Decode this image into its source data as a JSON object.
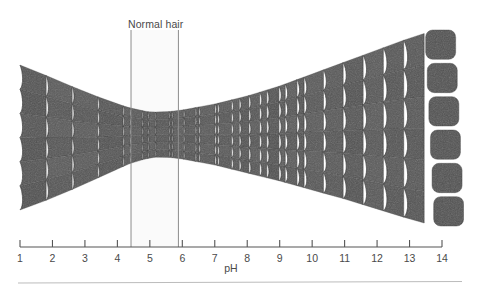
{
  "figure": {
    "type": "hair-cuticle-vs-ph-diagram",
    "background_color": "#ffffff",
    "scale_fill_color": "#565656",
    "scale_fill_color_dark": "#4a4a4a",
    "scale_edge_color": "#2e2e2e",
    "axis_color": "#555555",
    "text_color": "#4a4a4a",
    "marker_line_color": "#8c8c8c",
    "band_fill_color": "#fafafa",
    "rule_color": "#bcbcbc"
  },
  "annotation": {
    "normal_hair_label": "Normal hair",
    "label_x": 128,
    "label_y": 18,
    "band_start_ph": 4.42,
    "band_end_ph": 5.88,
    "line_top_y": 30,
    "line_bottom_y": 247
  },
  "axis": {
    "label": "pH",
    "label_x": 231,
    "label_y": 262,
    "min": 1,
    "max": 14,
    "line_y": 247,
    "tick_top_y": 240,
    "x_at_min": 20,
    "x_at_max": 442,
    "ticks": [
      {
        "value": 1,
        "label": "1"
      },
      {
        "value": 2,
        "label": "2"
      },
      {
        "value": 3,
        "label": "3"
      },
      {
        "value": 4,
        "label": "4"
      },
      {
        "value": 5,
        "label": "5"
      },
      {
        "value": 6,
        "label": "6"
      },
      {
        "value": 7,
        "label": "7"
      },
      {
        "value": 8,
        "label": "8"
      },
      {
        "value": 9,
        "label": "9"
      },
      {
        "value": 10,
        "label": "10"
      },
      {
        "value": 11,
        "label": "11"
      },
      {
        "value": 12,
        "label": "12"
      },
      {
        "value": 13,
        "label": "13"
      },
      {
        "value": 14,
        "label": "14"
      }
    ]
  },
  "bottom_rule": {
    "y": 283,
    "x_start": 18,
    "x_end": 462
  },
  "chart_data": {
    "type": "area",
    "xlabel": "pH",
    "ylabel": "",
    "xlim": [
      1,
      14
    ],
    "grid": false,
    "legend": null,
    "annotations": [
      "Normal hair"
    ],
    "x": [
      1,
      2,
      3,
      4,
      4.5,
      5,
      5.2,
      5.5,
      6,
      7,
      8,
      9,
      10,
      11,
      12,
      13,
      14
    ],
    "series": [
      {
        "name": "shaft top edge (y px)",
        "values": [
          65,
          78,
          92,
          104,
          109,
          112,
          112,
          112,
          110,
          104,
          96,
          86,
          74,
          62,
          50,
          38,
          28
        ]
      },
      {
        "name": "shaft bottom edge (y px)",
        "values": [
          210,
          198,
          184,
          169,
          162,
          158,
          157,
          157,
          159,
          165,
          173,
          181,
          190,
          199,
          209,
          219,
          228
        ]
      },
      {
        "name": "shaft thickness (px)",
        "values": [
          145,
          120,
          92,
          65,
          53,
          46,
          45,
          45,
          49,
          61,
          77,
          95,
          116,
          137,
          159,
          181,
          200
        ]
      }
    ],
    "columns": 30,
    "rows": 6,
    "detached_scale_count": 6
  }
}
